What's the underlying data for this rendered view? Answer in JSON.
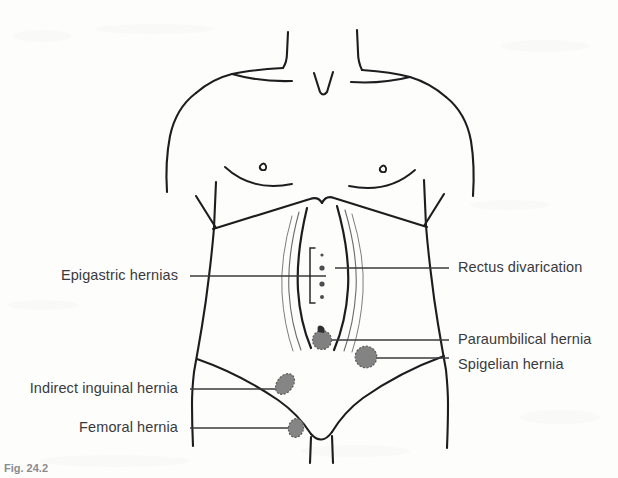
{
  "figure": {
    "caption": "Fig. 24.2",
    "background_color": "#fdfdfc",
    "line_color": "#1d1d1f",
    "text_color": "#3a3a3c",
    "hernia_marker_color": "#808080",
    "hernia_marker_outline": "#5a5a5a"
  },
  "labels": {
    "left": [
      {
        "name": "epigastric-hernias",
        "text": "Epigastric hernias",
        "text_x": 178,
        "text_y": 276,
        "leader_x1": 190,
        "leader_x2": 326,
        "leader_y": 276
      },
      {
        "name": "indirect-inguinal-hernia",
        "text": "Indirect inguinal hernia",
        "text_x": 178,
        "text_y": 389,
        "leader_x1": 190,
        "leader_x2": 285,
        "leader_y": 389
      },
      {
        "name": "femoral-hernia",
        "text": "Femoral hernia",
        "text_x": 178,
        "text_y": 428,
        "leader_x1": 190,
        "leader_x2": 298,
        "leader_y": 428
      }
    ],
    "right": [
      {
        "name": "rectus-divarication",
        "text": "Rectus divarication",
        "text_x": 458,
        "text_y": 268,
        "leader_x1": 335,
        "leader_x2": 449,
        "leader_y": 268
      },
      {
        "name": "paraumbilical-hernia",
        "text": "Paraumbilical hernia",
        "text_x": 458,
        "text_y": 340,
        "leader_x1": 322,
        "leader_x2": 449,
        "leader_y": 340
      },
      {
        "name": "spigelian-hernia",
        "text": "Spigelian hernia",
        "text_x": 458,
        "text_y": 365,
        "leader_x1": 366,
        "leader_x2": 449,
        "leader_y": 365
      }
    ]
  },
  "hernia_markers": [
    {
      "name": "paraumbilical-hernia-marker",
      "cx": 322,
      "cy": 340,
      "rx": 9.5,
      "ry": 9.5,
      "rotation": 0,
      "has_hook": true
    },
    {
      "name": "spigelian-hernia-marker",
      "cx": 366,
      "cy": 357,
      "rx": 11,
      "ry": 10.5,
      "rotation": 0,
      "has_hook": false
    },
    {
      "name": "indirect-inguinal-hernia-marker",
      "cx": 285,
      "cy": 384,
      "rx": 8,
      "ry": 11.5,
      "rotation": 38,
      "has_hook": false
    },
    {
      "name": "femoral-hernia-marker",
      "cx": 296,
      "cy": 428,
      "rx": 7.5,
      "ry": 9.5,
      "rotation": 12,
      "has_hook": false
    }
  ],
  "epigastric_defects": [
    {
      "cx": 322,
      "cy": 255,
      "r": 1.6
    },
    {
      "cx": 322,
      "cy": 268,
      "r": 2.6
    },
    {
      "cx": 322,
      "cy": 284,
      "r": 2.6
    },
    {
      "cx": 322,
      "cy": 297,
      "r": 2.0
    }
  ],
  "bracket": {
    "name": "epigastric-bracket",
    "x": 310,
    "y_top": 248,
    "y_bottom": 303,
    "tip": 5
  }
}
